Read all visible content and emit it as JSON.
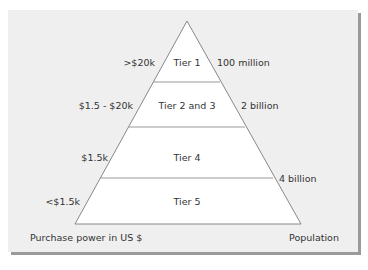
{
  "diagram": {
    "type": "pyramid",
    "colors": {
      "panel": "#efefef",
      "pyramid_fill": "#ffffff",
      "stroke": "#888888",
      "shadow": "#9a9a9a",
      "text": "#333333"
    },
    "tiers": [
      {
        "label": "Tier 1",
        "purchase_power": ">$20k",
        "population": "100 million"
      },
      {
        "label": "Tier 2 and 3",
        "purchase_power": "$1.5 - $20k",
        "population": "2 billion"
      },
      {
        "label": "Tier 4",
        "purchase_power": "$1.5k",
        "population": ""
      },
      {
        "label": "Tier 5",
        "purchase_power": "<$1.5k",
        "population": "4 billion"
      }
    ],
    "left_axis_label": "Purchase power in US $",
    "right_axis_label": "Population"
  }
}
